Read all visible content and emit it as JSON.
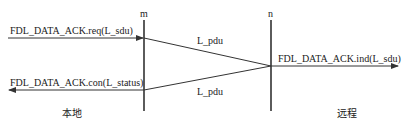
{
  "diagram": {
    "title": "",
    "nodes": {
      "m": {
        "label": "m",
        "x": 144
      },
      "n": {
        "label": "n",
        "x": 271
      }
    },
    "messages": {
      "req": {
        "label": "FDL_DATA_ACK.req(L_sdu)"
      },
      "pdu_forward": {
        "label": "L_pdu"
      },
      "ind": {
        "label": "FDL_DATA_ACK.ind(L_sdu)"
      },
      "con": {
        "label": "FDL_DATA_ACK.con(L_status)"
      },
      "pdu_return": {
        "label": "L_pdu"
      }
    },
    "sides": {
      "local": {
        "label": "本地"
      },
      "remote": {
        "label": "远程"
      }
    },
    "colors": {
      "line": "#333333",
      "text": "#222222",
      "background": "#ffffff"
    }
  }
}
